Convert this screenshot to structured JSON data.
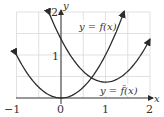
{
  "chart_data": {
    "type": "line",
    "title": "",
    "xlabel": "x",
    "ylabel": "y",
    "xlim": [
      -1,
      2
    ],
    "ylim": [
      0,
      2
    ],
    "grid": true,
    "grid_step": 0.5,
    "x_ticks": [
      "-1",
      "0",
      "1",
      "2"
    ],
    "y_ticks": [
      "1",
      "2"
    ],
    "series": [
      {
        "name": "y = f(x)",
        "label": "y = f(x)",
        "formula_estimate": "y = x^2",
        "x": [
          -1,
          -0.5,
          0,
          0.5,
          1,
          1.42
        ],
        "y": [
          1,
          0.25,
          0,
          0.25,
          1,
          2.0
        ]
      },
      {
        "name": "y = f̄(x)",
        "label": "y = f̄(x)",
        "formula_estimate": "y = (x-1)^2 + 0.37",
        "x": [
          -0.25,
          0,
          0.5,
          1,
          1.5,
          2
        ],
        "y": [
          1.93,
          1.37,
          0.62,
          0.37,
          0.62,
          1.37
        ]
      }
    ],
    "annotations": [
      {
        "text": "y = f(x)",
        "near": [
          0.9,
          1.55
        ]
      },
      {
        "text": "y = f̄(x)",
        "near": [
          1.35,
          0.2
        ]
      }
    ]
  },
  "axes": {
    "x_label": "x",
    "y_label": "y",
    "x_ticks": [
      {
        "value": -1,
        "text": "−1"
      },
      {
        "value": 0,
        "text": "0"
      },
      {
        "value": 1,
        "text": "1"
      },
      {
        "value": 2,
        "text": "2"
      }
    ],
    "y_ticks": [
      {
        "value": 1,
        "text": "1"
      },
      {
        "value": 2,
        "text": "2"
      }
    ]
  },
  "labels": {
    "f_label": "y = f(x)",
    "fbar_label": "y = f̄(x)"
  },
  "colors": {
    "curve": "#2b2b2b",
    "grid": "#d9d9d9",
    "axis": "#333333"
  }
}
